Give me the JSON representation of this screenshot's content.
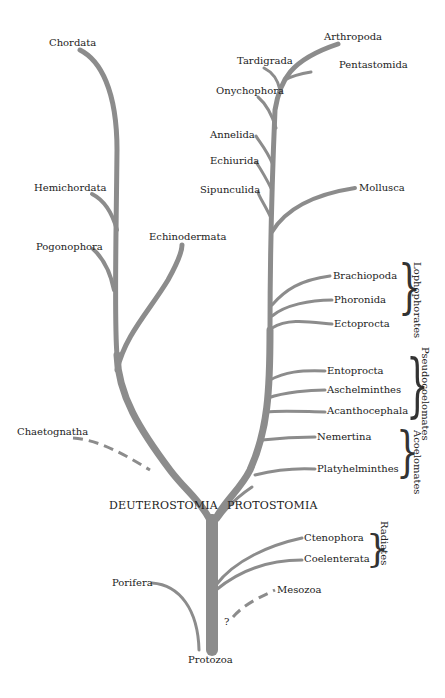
{
  "diagram": {
    "type": "phylogenetic-tree",
    "root": "Protozoa",
    "main_divisions": [
      "DEUTEROSTOMIA",
      "PROTOSTOMIA"
    ],
    "deuterostomia": [
      "Chordata",
      "Hemichordata",
      "Pogonophora",
      "Echinodermata",
      "Chaetognatha"
    ],
    "protostomia": [
      "Arthropoda",
      "Tardigrada",
      "Pentastomida",
      "Onychophora",
      "Annelida",
      "Echiurida",
      "Sipunculida",
      "Mollusca",
      "Brachiopoda",
      "Phoronida",
      "Ectoprocta",
      "Entoprocta",
      "Aschelminthes",
      "Acanthocephala",
      "Nemertina",
      "Platyhelminthes"
    ],
    "base": [
      "Ctenophora",
      "Coelenterata",
      "Porifera",
      "Mesozoa"
    ],
    "uncertain_marker": "?",
    "groups": {
      "lophophorates": "Lophophorates",
      "pseudocoelomates": "Pseudocoelomates",
      "acoelomates": "Acoelomates",
      "radiates": "Radiates"
    },
    "colors": {
      "branch": "#8c8c8c",
      "text": "#222222",
      "background": "#ffffff"
    }
  }
}
